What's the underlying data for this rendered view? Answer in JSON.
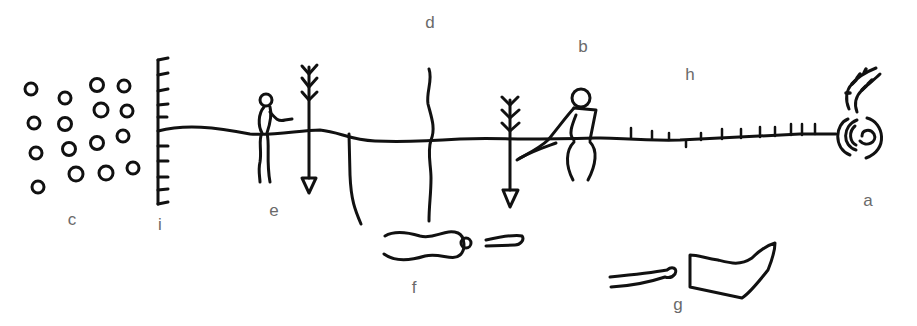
{
  "diagram": {
    "type": "petroglyph line drawing with lettered figure labels",
    "stroke_color": "#111111",
    "label_color": "#6a6a6a",
    "labels": {
      "a": "a",
      "b": "b",
      "c": "c",
      "d": "d",
      "e": "e",
      "f": "f",
      "g": "g",
      "h": "h",
      "i": "i"
    },
    "figures": [
      {
        "id": "a",
        "description": "concentric spiral with two fringed arcs above"
      },
      {
        "id": "b",
        "description": "seated human figure reaching down"
      },
      {
        "id": "c",
        "description": "cluster of small circles"
      },
      {
        "id": "d",
        "description": "vertical wavy line"
      },
      {
        "id": "e",
        "description": "small standing human figure"
      },
      {
        "id": "f",
        "description": "elongated body shape with head and stick"
      },
      {
        "id": "g",
        "description": "boot-shaped figure with stick"
      },
      {
        "id": "h",
        "description": "horizontal line with tick marks"
      },
      {
        "id": "i",
        "description": "vertical comb-like line"
      }
    ]
  }
}
